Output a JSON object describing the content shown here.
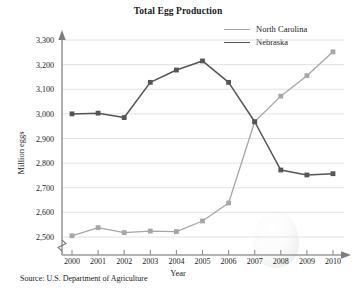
{
  "chart_data": {
    "type": "line",
    "title": "Total Egg Production",
    "xlabel": "Year",
    "ylabel": "Million eggs",
    "x": [
      2000,
      2001,
      2002,
      2003,
      2004,
      2005,
      2006,
      2007,
      2008,
      2009,
      2010
    ],
    "xtick_labels": [
      "2000",
      "2001",
      "2002",
      "2003",
      "2004",
      "2005",
      "2006",
      "2007",
      "2008",
      "2009",
      "2010"
    ],
    "ytick_labels": [
      "2,500",
      "2,600",
      "2,700",
      "2,800",
      "2,900",
      "3,000",
      "3,100",
      "3,200",
      "3,300"
    ],
    "ytick_values": [
      2500,
      2600,
      2700,
      2800,
      2900,
      3000,
      3100,
      3200,
      3300
    ],
    "ylim": [
      2450,
      3320
    ],
    "xlim": [
      1999.6,
      2010.6
    ],
    "grid": "horizontal",
    "axis_break": true,
    "legend_position": "top-right",
    "series": [
      {
        "name": "North Carolina",
        "color": "#a6a6a6",
        "marker": "square",
        "values": [
          2505,
          2538,
          2518,
          2524,
          2522,
          2565,
          2638,
          2968,
          3072,
          3155,
          3252
        ]
      },
      {
        "name": "Nebraska",
        "color": "#555555",
        "marker": "square",
        "values": [
          3000,
          3003,
          2985,
          3128,
          3178,
          3215,
          3128,
          2968,
          2772,
          2752,
          2757
        ]
      }
    ],
    "source": "Source: U.S. Department of Agriculture"
  },
  "annotations": {
    "egg_watermark": "egg-shape-watermark"
  }
}
